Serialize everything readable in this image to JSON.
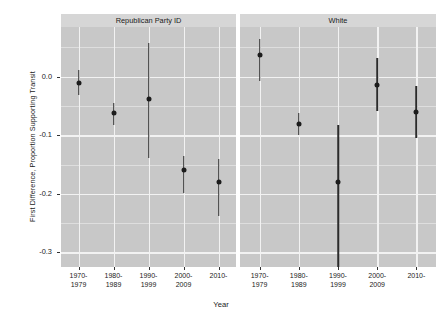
{
  "chart_data": {
    "type": "scatter",
    "title": "",
    "xlabel": "Year",
    "ylabel": "First Difference, Proportion Supporting Transit",
    "categories": [
      "1970-\n1979",
      "1980-\n1989",
      "1990-\n1999",
      "2000-\n2009",
      "2010-"
    ],
    "ylim": [
      -0.325,
      0.085
    ],
    "yticks": [
      0.0,
      -0.1,
      -0.2,
      -0.3
    ],
    "ytick_labels": [
      "0.0",
      "-0.1",
      "-0.2",
      "-0.3"
    ],
    "grid": true,
    "legend": false,
    "panels": [
      {
        "label": "Republican Party ID",
        "points": [
          {
            "x": "1970-1979",
            "estimate": -0.01,
            "low": -0.031,
            "high": 0.012
          },
          {
            "x": "1980-1989",
            "estimate": -0.062,
            "low": -0.083,
            "high": -0.045
          },
          {
            "x": "1990-1999",
            "estimate": -0.038,
            "low": -0.139,
            "high": 0.058
          },
          {
            "x": "2000-2009",
            "estimate": -0.16,
            "low": -0.199,
            "high": -0.136
          },
          {
            "x": "2010-",
            "estimate": -0.179,
            "low": -0.238,
            "high": -0.141
          }
        ]
      },
      {
        "label": "White",
        "points": [
          {
            "x": "1970-1979",
            "estimate": 0.037,
            "low": -0.008,
            "high": 0.064
          },
          {
            "x": "1980-1989",
            "estimate": -0.08,
            "low": -0.1,
            "high": -0.062
          },
          {
            "x": "1990-1999",
            "estimate": -0.179,
            "low": -0.33,
            "high": -0.083
          },
          {
            "x": "2000-2009",
            "estimate": -0.014,
            "low": -0.059,
            "high": 0.032
          },
          {
            "x": "2010-",
            "estimate": -0.06,
            "low": -0.104,
            "high": -0.015
          }
        ]
      }
    ]
  }
}
